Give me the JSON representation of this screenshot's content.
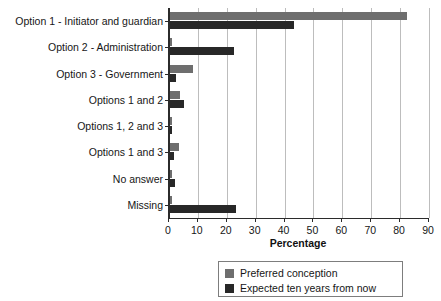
{
  "chart_data": {
    "type": "bar",
    "orientation": "horizontal",
    "title": "",
    "xlabel": "Percentage",
    "ylabel": "",
    "xlim": [
      0,
      90
    ],
    "xticks": [
      0,
      10,
      20,
      30,
      40,
      50,
      60,
      70,
      80,
      90
    ],
    "grid": true,
    "legend_position": "bottom",
    "categories": [
      "Option 1 - Initiator and guardian",
      "Option 2 - Administration",
      "Option 3 - Government",
      "Options 1 and 2",
      "Options 1, 2 and 3",
      "Options 1 and 3",
      "No answer",
      "Missing"
    ],
    "series": [
      {
        "name": "Preferred conception",
        "color": "#6e6e6e",
        "values": [
          82,
          0.5,
          8,
          3.5,
          0.5,
          3,
          0.3,
          0.5
        ]
      },
      {
        "name": "Expected ten years from now",
        "color": "#282828",
        "values": [
          43,
          22,
          2,
          5,
          0.5,
          1.5,
          1.8,
          23
        ]
      }
    ]
  },
  "legend": {
    "items": [
      {
        "label": "Preferred conception",
        "color": "#6e6e6e"
      },
      {
        "label": "Expected ten years from now",
        "color": "#282828"
      }
    ]
  }
}
